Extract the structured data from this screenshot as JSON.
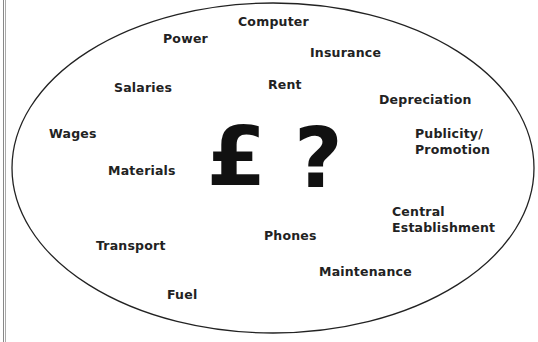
{
  "diagram": {
    "clipped_header": "",
    "center_symbols": {
      "currency": "£",
      "question": "?"
    },
    "cost_labels": [
      {
        "id": "computer",
        "text": "Computer",
        "x": 238,
        "y": 14
      },
      {
        "id": "power",
        "text": "Power",
        "x": 163,
        "y": 31
      },
      {
        "id": "insurance",
        "text": "Insurance",
        "x": 310,
        "y": 45
      },
      {
        "id": "salaries",
        "text": "Salaries",
        "x": 114,
        "y": 80
      },
      {
        "id": "rent",
        "text": "Rent",
        "x": 268,
        "y": 77
      },
      {
        "id": "depreciation",
        "text": "Depreciation",
        "x": 379,
        "y": 92
      },
      {
        "id": "wages",
        "text": "Wages",
        "x": 49,
        "y": 126
      },
      {
        "id": "publicity",
        "text": "Publicity/",
        "x": 415,
        "y": 126
      },
      {
        "id": "promotion",
        "text": "Promotion",
        "x": 415,
        "y": 142
      },
      {
        "id": "materials",
        "text": "Materials",
        "x": 108,
        "y": 163
      },
      {
        "id": "central",
        "text": "Central",
        "x": 392,
        "y": 204
      },
      {
        "id": "establishment",
        "text": "Establishment",
        "x": 392,
        "y": 220
      },
      {
        "id": "phones",
        "text": "Phones",
        "x": 264,
        "y": 228
      },
      {
        "id": "transport",
        "text": "Transport",
        "x": 96,
        "y": 238
      },
      {
        "id": "maintenance",
        "text": "Maintenance",
        "x": 319,
        "y": 264
      },
      {
        "id": "fuel",
        "text": "Fuel",
        "x": 167,
        "y": 287
      }
    ],
    "ellipse": {
      "cx": 273,
      "cy": 168,
      "rx": 261,
      "ry": 165,
      "stroke": "#222222"
    }
  }
}
